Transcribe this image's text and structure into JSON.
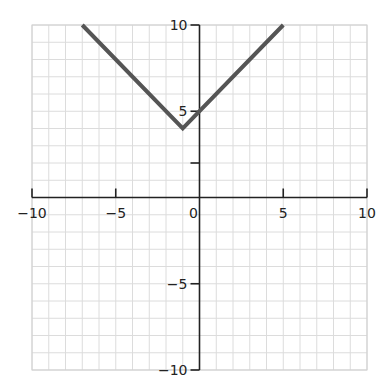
{
  "chart_data": {
    "type": "line",
    "title": "",
    "xlabel": "",
    "ylabel": "",
    "xlim": [
      -10,
      10
    ],
    "ylim": [
      -10,
      10
    ],
    "grid": true,
    "grid_step": 1,
    "x_ticks": [
      -10,
      -5,
      0,
      5,
      10
    ],
    "x_tick_labels": [
      "−10",
      "−5",
      "0",
      "5",
      "10"
    ],
    "y_ticks": [
      10,
      5,
      2,
      -5,
      -10
    ],
    "y_tick_labels": [
      "10",
      "5",
      "",
      "−5",
      "−10"
    ],
    "series": [
      {
        "name": "y = |x + 1| + 4",
        "x": [
          -7,
          -1,
          5
        ],
        "y": [
          10,
          4,
          10
        ],
        "color": "#555555"
      }
    ],
    "legend": null
  },
  "colors": {
    "grid": "#dcdcdc",
    "axis": "#222222",
    "line": "#555555"
  }
}
